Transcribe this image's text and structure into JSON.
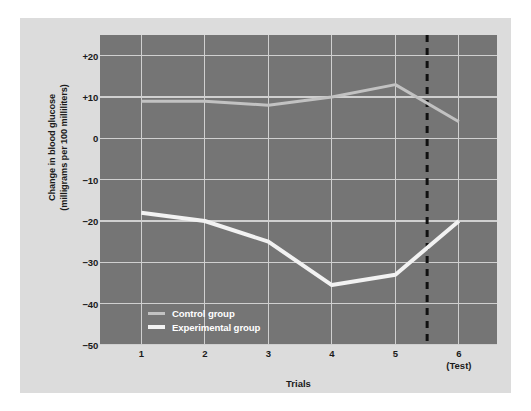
{
  "chart_data": {
    "type": "line",
    "title": "",
    "xlabel": "Trials",
    "ylabel": "Change in blood glucose\n(milligrams per 100 milliliters)",
    "x": [
      1,
      2,
      3,
      4,
      5,
      6
    ],
    "categories": [
      "1",
      "2",
      "3",
      "4",
      "5",
      "6"
    ],
    "xtick_labels": [
      "1",
      "2",
      "3",
      "4",
      "5",
      "6"
    ],
    "xtick_sublabels": [
      "",
      "",
      "",
      "",
      "",
      "(Test)"
    ],
    "ytick_labels": [
      "+20",
      "+10",
      "0",
      "−10",
      "−20",
      "−30",
      "−40",
      "−50"
    ],
    "ytick_values": [
      20,
      10,
      0,
      -10,
      -20,
      -30,
      -40,
      -50
    ],
    "ylim": [
      -50,
      25
    ],
    "xlim": [
      0.35,
      6.6
    ],
    "grid": true,
    "legend_position": "inside-lower-left",
    "series": [
      {
        "name": "Control group",
        "color": "#c2c2c2",
        "width": 3.0,
        "values": [
          9,
          9,
          8,
          10,
          13,
          4
        ]
      },
      {
        "name": "Experimental group",
        "color": "#f2f2f2",
        "width": 4.0,
        "values": [
          -18,
          -20,
          -25,
          -35.5,
          -33,
          -20
        ]
      }
    ],
    "annotations": [
      {
        "type": "vline",
        "name": "test-divider",
        "x": 5.5,
        "style": "dashed",
        "color": "#111111",
        "width": 3
      }
    ],
    "colors": {
      "page_background": "#ffffff",
      "card_background": "#dcdcdc",
      "plot_background": "#757575",
      "grid": "#d0d0d0",
      "axis_text": "#1a1a1a",
      "legend_text": "#ffffff"
    }
  },
  "legend": {
    "items": [
      {
        "label": "Control group",
        "swatch": "control-swatch"
      },
      {
        "label": "Experimental group",
        "swatch": "experimental-swatch"
      }
    ]
  },
  "axes": {
    "x_title": "Trials",
    "y_title_line1": "Change in blood glucose",
    "y_title_line2": "(milligrams per 100 milliliters)"
  }
}
